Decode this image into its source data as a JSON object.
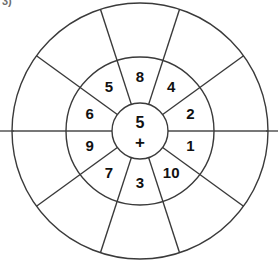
{
  "worksheet": {
    "question_number": "3)",
    "type": "addition-wheel",
    "center_value": "5",
    "center_operator": "+",
    "geometry": {
      "center_x": 140,
      "center_y": 131,
      "inner_radius": 28,
      "middle_radius": 74,
      "outer_radius": 128,
      "sector_count": 10,
      "sector_degrees": 36,
      "start_angle_deg": 0
    },
    "colors": {
      "line": "#3a3a3a",
      "background": "#ffffff",
      "text": "#111111",
      "question_number": "#6d6d6d"
    },
    "inner_ring_labels": [
      "1",
      "10",
      "3",
      "7",
      "9",
      "6",
      "5",
      "8",
      "4",
      "2"
    ],
    "outer_ring_labels": [
      "",
      "",
      "",
      "",
      "",
      "",
      "",
      "",
      "",
      ""
    ]
  },
  "chart_data": {
    "type": "pie",
    "center_label": "5 +",
    "categories": [
      "1",
      "10",
      "3",
      "7",
      "9",
      "6",
      "5",
      "8",
      "4",
      "2"
    ],
    "values": [
      36,
      36,
      36,
      36,
      36,
      36,
      36,
      36,
      36,
      36
    ],
    "legend": "none",
    "grid": false,
    "xlabel": "",
    "ylabel": ""
  }
}
